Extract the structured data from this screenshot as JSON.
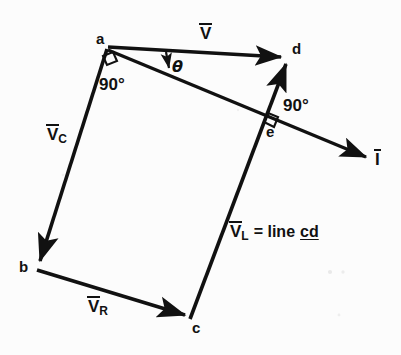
{
  "figure": {
    "background_color": "#fcfcfc",
    "ink_color": "#111111",
    "width": 401,
    "height": 355,
    "points": {
      "a": {
        "label": "a",
        "x": 107,
        "y": 48,
        "label_x": 96,
        "label_y": 33
      },
      "b": {
        "label": "b",
        "x": 37,
        "y": 268,
        "label_x": 20,
        "label_y": 267
      },
      "c": {
        "label": "c",
        "x": 190,
        "y": 320,
        "label_x": 192,
        "label_y": 323
      },
      "d": {
        "label": "d",
        "x": 288,
        "y": 58,
        "label_x": 292,
        "label_y": 42
      },
      "e": {
        "label": "e",
        "x": 273,
        "y": 126,
        "label_x": 268,
        "label_y": 128
      }
    },
    "vectors": [
      {
        "name": "V",
        "label": "V",
        "subscript": "",
        "from": "a",
        "to": "d",
        "label_x": 200,
        "label_y": 26
      },
      {
        "name": "VC",
        "label": "V",
        "subscript": "C",
        "from": "a",
        "to": "b",
        "label_x": 48,
        "label_y": 127
      },
      {
        "name": "VR",
        "label": "V",
        "subscript": "R",
        "from": "b",
        "to": "c",
        "label_x": 88,
        "label_y": 299
      },
      {
        "name": "VL",
        "label": "V",
        "subscript": "L",
        "from": "c",
        "to": "d",
        "label_x": 231,
        "label_y": 224
      },
      {
        "name": "I",
        "label": "I",
        "subscript": "",
        "from": "a",
        "to": "I-tip",
        "label_x": 376,
        "label_y": 152
      }
    ],
    "annotations": [
      {
        "name": "vl-equation",
        "text_before": "= line",
        "text_underlined": "cd",
        "x": 268,
        "y": 224
      },
      {
        "name": "right-angle-a",
        "text": "90°",
        "x": 99,
        "y": 78
      },
      {
        "name": "right-angle-e",
        "text": "90°",
        "x": 283,
        "y": 99
      },
      {
        "name": "theta-angle",
        "text": "θ",
        "x": 172,
        "y": 60
      }
    ]
  }
}
